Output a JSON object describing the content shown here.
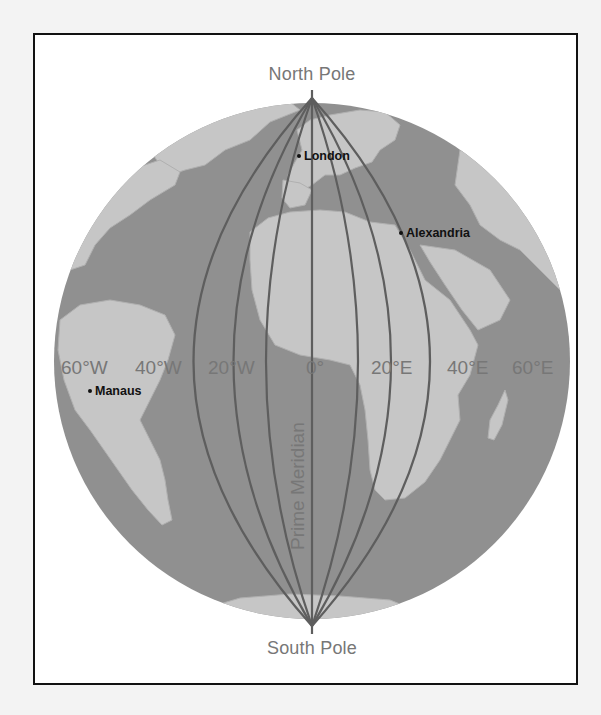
{
  "map": {
    "title_poles": {
      "north": "North Pole",
      "south": "South Pole"
    },
    "prime_meridian_label": "Prime Meridian",
    "longitude_labels": [
      "60°W",
      "40°W",
      "20°W",
      "0°",
      "20°E",
      "40°E",
      "60°E"
    ],
    "cities": [
      {
        "name": "London"
      },
      {
        "name": "Alexandria"
      },
      {
        "name": "Manaus"
      }
    ],
    "colors": {
      "ocean": "#8f8f8f",
      "land": "#c4c4c4",
      "meridian_line": "#5e5e5e",
      "label_gray": "#777777",
      "frame_border": "#111111"
    }
  }
}
